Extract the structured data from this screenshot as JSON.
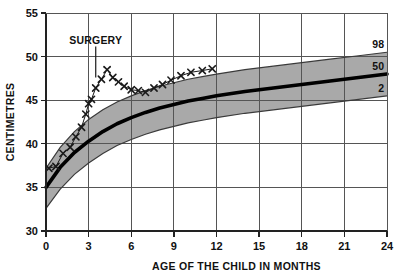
{
  "chart_data": {
    "type": "line",
    "title": "",
    "subtitle": "",
    "xlabel": "AGE OF THE CHILD IN MONTHS",
    "ylabel": "CENTIMETRES",
    "xlim": [
      0,
      24
    ],
    "ylim": [
      30,
      55
    ],
    "x_ticks": [
      0,
      3,
      6,
      9,
      12,
      15,
      18,
      21,
      24
    ],
    "y_ticks": [
      30,
      35,
      40,
      45,
      50,
      55
    ],
    "x_tick_labels": [
      "0",
      "3",
      "6",
      "9",
      "12",
      "15",
      "18",
      "21",
      "24"
    ],
    "y_tick_labels": [
      "30",
      "35",
      "40",
      "45",
      "50",
      "55"
    ],
    "grid": true,
    "legend_position": "right-inline",
    "band_color": "#a9a9a9",
    "line_color": "#000000",
    "series": [
      {
        "name": "98",
        "label": "98",
        "role": "percentile-upper",
        "x": [
          0,
          1,
          2,
          3,
          4,
          5,
          6,
          7,
          8,
          9,
          10,
          11,
          12,
          14,
          16,
          18,
          20,
          22,
          24
        ],
        "values": [
          37.2,
          39.6,
          41.4,
          42.8,
          43.9,
          44.8,
          45.5,
          46.1,
          46.6,
          47.0,
          47.4,
          47.7,
          48.0,
          48.5,
          48.9,
          49.3,
          49.7,
          50.1,
          50.5
        ]
      },
      {
        "name": "50",
        "label": "50",
        "role": "percentile-median",
        "x": [
          0,
          1,
          2,
          3,
          4,
          5,
          6,
          7,
          8,
          9,
          10,
          11,
          12,
          14,
          16,
          18,
          20,
          22,
          24
        ],
        "values": [
          35.0,
          37.3,
          39.0,
          40.3,
          41.4,
          42.3,
          43.0,
          43.6,
          44.1,
          44.5,
          44.9,
          45.2,
          45.5,
          46.0,
          46.4,
          46.8,
          47.2,
          47.6,
          48.0
        ]
      },
      {
        "name": "2",
        "label": "2",
        "role": "percentile-lower",
        "x": [
          0,
          1,
          2,
          3,
          4,
          5,
          6,
          7,
          8,
          9,
          10,
          11,
          12,
          14,
          16,
          18,
          20,
          22,
          24
        ],
        "values": [
          32.6,
          34.8,
          36.5,
          37.8,
          38.9,
          39.8,
          40.5,
          41.1,
          41.6,
          42.0,
          42.4,
          42.7,
          43.0,
          43.5,
          43.9,
          44.3,
          44.7,
          45.1,
          45.5
        ]
      },
      {
        "name": "patient",
        "label": "",
        "role": "patient-measurements",
        "marker": "x-cross",
        "x": [
          0.2,
          0.7,
          1.2,
          1.7,
          2.1,
          2.5,
          2.8,
          3.0,
          3.2,
          3.5,
          3.9,
          4.3,
          4.7,
          5.1,
          5.5,
          6.0,
          6.5,
          7.0,
          7.6,
          8.2,
          8.8,
          9.5,
          10.2,
          11.0,
          11.7
        ],
        "values": [
          37.2,
          37.4,
          38.9,
          39.6,
          40.8,
          41.9,
          43.4,
          44.6,
          45.1,
          46.4,
          47.4,
          48.5,
          47.6,
          47.1,
          46.6,
          46.2,
          46.1,
          45.9,
          46.4,
          46.8,
          47.3,
          47.8,
          48.2,
          48.4,
          48.6
        ]
      }
    ],
    "annotations": [
      {
        "name": "surgery",
        "text": "SURGERY",
        "x": 3.5,
        "y": 51.5,
        "pointer_to_x": 3.5,
        "pointer_to_y": 47.6
      }
    ]
  },
  "axis": {
    "y_title": "CENTIMETRES",
    "x_title": "AGE OF THE CHILD IN MONTHS"
  },
  "percentile_labels": {
    "upper": "98",
    "median": "50",
    "lower": "2"
  },
  "annotation": {
    "surgery": "SURGERY"
  }
}
